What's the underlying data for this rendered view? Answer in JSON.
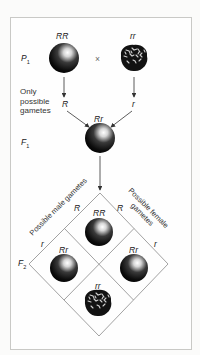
{
  "diagram": {
    "type": "monohybrid-cross",
    "parents": {
      "generation_label": "P",
      "generation_subscript": "1",
      "left": {
        "genotype": "RR",
        "phenotype": "round"
      },
      "cross_symbol": "×",
      "right": {
        "genotype": "rr",
        "phenotype": "wrinkled"
      }
    },
    "gametes_note": "Only possible gametes",
    "parent_gametes": {
      "left": "R",
      "right": "r"
    },
    "f1": {
      "generation_label": "F",
      "generation_subscript": "1",
      "genotype": "Rr",
      "phenotype": "round"
    },
    "punnett": {
      "male_label": "Possible male gametes",
      "female_label": "Possible female gametes",
      "male_gametes": [
        "R",
        "r"
      ],
      "female_gametes": [
        "R",
        "r"
      ],
      "generation_label": "F",
      "generation_subscript": "2",
      "cells": [
        {
          "position": "top",
          "genotype": "RR",
          "phenotype": "round"
        },
        {
          "position": "left",
          "genotype": "Rr",
          "phenotype": "round"
        },
        {
          "position": "right",
          "genotype": "Rr",
          "phenotype": "round"
        },
        {
          "position": "bottom",
          "genotype": "rr",
          "phenotype": "wrinkled"
        }
      ]
    },
    "colors": {
      "frame": "#c9c9c6",
      "lines": "#8a8a8a",
      "seed": "#111111"
    }
  }
}
